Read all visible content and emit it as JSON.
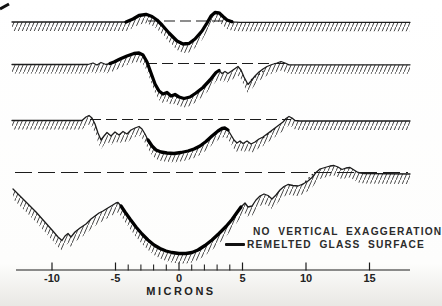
{
  "figure": {
    "background": "#ffffff",
    "ink_color": "#1c1c1c",
    "legend": {
      "line1": "NO VERTICAL EXAGGERATION",
      "line2": "REMELTED GLASS SURFACE",
      "swatch": "thick-black-line"
    }
  },
  "chart_data": {
    "type": "line",
    "title": "",
    "xlabel": "MICRONS",
    "ylabel": "",
    "annotations": [
      "NO VERTICAL EXAGGERATION",
      "REMELTED GLASS SURFACE"
    ],
    "x_axis": {
      "unit": "microns",
      "major_ticks": [
        -10,
        -5,
        0,
        5,
        10,
        15
      ],
      "minor_ticks": [
        -4,
        -3,
        -2,
        -1,
        1,
        2,
        3,
        4
      ],
      "range_px": [
        16,
        410
      ],
      "axis_y_px": 270,
      "x_px_at_zero_microns": 179,
      "px_per_micron": 12.7,
      "tick_label_y_px": 282,
      "xlabel_y_px": 295
    },
    "profiles_note": "Four stacked profilometer traces of a laser crater; hatching = bulk glass below surface; thick line = remelted glass surface; dashed line = original surface level. Coordinates in screen px; microns via x_axis mapping.",
    "profiles": [
      {
        "name": "profile-1-shallow",
        "baseline_y_px": 22,
        "hatch_band_px": 9,
        "dash_pattern": "11 5",
        "dashed_ref": {
          "y": 21,
          "x1": 148,
          "x2": 233
        },
        "remelt_x_range": [
          125,
          233
        ],
        "dotted_segment": null,
        "surface_px": [
          [
            12,
            22
          ],
          [
            126,
            22
          ],
          [
            133,
            19
          ],
          [
            139,
            15.5
          ],
          [
            146,
            14.3
          ],
          [
            152,
            16.5
          ],
          [
            157,
            20
          ],
          [
            162,
            25
          ],
          [
            169,
            33
          ],
          [
            177,
            41
          ],
          [
            183,
            44
          ],
          [
            189,
            43.5
          ],
          [
            195,
            39
          ],
          [
            202,
            31
          ],
          [
            207,
            23
          ],
          [
            211,
            16
          ],
          [
            215,
            12.5
          ],
          [
            219,
            12.8
          ],
          [
            223,
            16.5
          ],
          [
            227,
            20
          ],
          [
            232,
            21.8
          ],
          [
            240,
            22.3
          ],
          [
            410,
            22.3
          ]
        ]
      },
      {
        "name": "profile-2",
        "baseline_y_px": 64.5,
        "hatch_band_px": 9,
        "dash_pattern": "11 5",
        "dashed_ref": {
          "y": 63.5,
          "x1": 146,
          "x2": 288
        },
        "remelt_x_range": [
          110,
          220
        ],
        "dotted_segment": [
          [
            251,
            80
          ],
          [
            265,
            70
          ]
        ],
        "surface_px": [
          [
            12,
            64.5
          ],
          [
            88,
            64.5
          ],
          [
            93,
            63
          ],
          [
            97,
            65
          ],
          [
            101,
            62.5
          ],
          [
            106,
            64.5
          ],
          [
            110,
            63.5
          ],
          [
            114,
            62
          ],
          [
            120,
            59
          ],
          [
            127,
            56
          ],
          [
            134,
            53.5
          ],
          [
            139,
            53
          ],
          [
            143,
            55
          ],
          [
            147,
            62
          ],
          [
            151,
            73
          ],
          [
            155,
            84
          ],
          [
            159,
            91
          ],
          [
            163,
            94
          ],
          [
            167,
            92.5
          ],
          [
            171,
            96
          ],
          [
            175,
            94.5
          ],
          [
            179,
            97
          ],
          [
            184,
            98.5
          ],
          [
            190,
            97
          ],
          [
            196,
            93
          ],
          [
            203,
            87.5
          ],
          [
            210,
            80
          ],
          [
            216,
            72.5
          ],
          [
            219,
            70.5
          ],
          [
            222,
            73.5
          ],
          [
            225,
            71.5
          ],
          [
            228,
            73.5
          ],
          [
            233,
            70
          ],
          [
            238,
            66.5
          ],
          [
            241,
            70
          ],
          [
            244,
            77
          ],
          [
            248,
            84.5
          ],
          [
            251,
            81
          ],
          [
            255,
            76
          ],
          [
            259,
            72
          ],
          [
            263,
            69
          ],
          [
            267,
            66.5
          ],
          [
            272,
            64.5
          ],
          [
            277,
            63
          ],
          [
            281,
            61.5
          ],
          [
            285,
            63
          ],
          [
            289,
            64.8
          ],
          [
            296,
            64.8
          ],
          [
            410,
            64.8
          ]
        ]
      },
      {
        "name": "profile-3",
        "baseline_y_px": 120.5,
        "hatch_band_px": 9,
        "dash_pattern": "11 5",
        "dashed_ref": {
          "y": 119.5,
          "x1": 90,
          "x2": 291
        },
        "remelt_x_range": [
          147,
          228
        ],
        "dotted_segment": [
          [
            263,
            138
          ],
          [
            277,
            127
          ]
        ],
        "surface_px": [
          [
            12,
            120.5
          ],
          [
            82,
            120.5
          ],
          [
            86,
            117
          ],
          [
            89,
            115.5
          ],
          [
            92,
            118
          ],
          [
            95,
            124
          ],
          [
            98,
            133
          ],
          [
            101,
            140
          ],
          [
            104,
            136
          ],
          [
            107,
            132.5
          ],
          [
            111,
            136
          ],
          [
            115,
            132
          ],
          [
            119,
            135
          ],
          [
            123,
            131.5
          ],
          [
            127,
            134
          ],
          [
            131,
            130
          ],
          [
            135,
            128
          ],
          [
            139,
            126.5
          ],
          [
            142,
            129
          ],
          [
            145,
            134
          ],
          [
            148,
            140
          ],
          [
            152,
            146
          ],
          [
            156,
            150
          ],
          [
            161,
            152
          ],
          [
            167,
            153
          ],
          [
            174,
            153.5
          ],
          [
            181,
            152.5
          ],
          [
            188,
            151
          ],
          [
            194,
            149
          ],
          [
            200,
            146
          ],
          [
            206,
            141.5
          ],
          [
            212,
            136
          ],
          [
            218,
            131
          ],
          [
            222,
            128.5
          ],
          [
            225,
            128
          ],
          [
            228,
            130
          ],
          [
            231,
            135
          ],
          [
            234,
            140
          ],
          [
            237,
            143
          ],
          [
            240,
            141
          ],
          [
            243,
            143.5
          ],
          [
            247,
            141
          ],
          [
            251,
            144
          ],
          [
            255,
            142
          ],
          [
            259,
            139
          ],
          [
            263,
            137
          ],
          [
            267,
            134
          ],
          [
            271,
            131
          ],
          [
            275,
            128
          ],
          [
            279,
            125
          ],
          [
            283,
            122
          ],
          [
            286,
            118.5
          ],
          [
            289,
            116.5
          ],
          [
            292,
            118
          ],
          [
            295,
            120.5
          ],
          [
            300,
            121
          ],
          [
            410,
            121
          ]
        ]
      },
      {
        "name": "profile-4-deep",
        "baseline_y_px": 172.5,
        "hatch_band_px": 10,
        "dash_pattern": "17 6",
        "dashed_ref": {
          "y": 172.5,
          "x1": 15,
          "x2": 408
        },
        "remelt_x_range": [
          119,
          243.5
        ],
        "dotted_segment": [
          [
            302,
            185
          ],
          [
            314,
            173
          ]
        ],
        "surface_px": [
          [
            13,
            189
          ],
          [
            20,
            196
          ],
          [
            28,
            204
          ],
          [
            36,
            212
          ],
          [
            44,
            221
          ],
          [
            52,
            230
          ],
          [
            58,
            237
          ],
          [
            62,
            240.5
          ],
          [
            65,
            236
          ],
          [
            68,
            233.5
          ],
          [
            71,
            237
          ],
          [
            75,
            232
          ],
          [
            80,
            228
          ],
          [
            86,
            224
          ],
          [
            91,
            219
          ],
          [
            95,
            216
          ],
          [
            99,
            213
          ],
          [
            103,
            211
          ],
          [
            107,
            208.5
          ],
          [
            112,
            205.5
          ],
          [
            116,
            203
          ],
          [
            118,
            202.5
          ],
          [
            121,
            206
          ],
          [
            125,
            212
          ],
          [
            130,
            219
          ],
          [
            136,
            227
          ],
          [
            142,
            234
          ],
          [
            148,
            240
          ],
          [
            154,
            245
          ],
          [
            160,
            248.5
          ],
          [
            166,
            251
          ],
          [
            172,
            252.5
          ],
          [
            179,
            253.5
          ],
          [
            186,
            253.5
          ],
          [
            192,
            252.5
          ],
          [
            198,
            250
          ],
          [
            205,
            245.5
          ],
          [
            212,
            240
          ],
          [
            219,
            233.5
          ],
          [
            226,
            226.5
          ],
          [
            232,
            219.5
          ],
          [
            237,
            212.5
          ],
          [
            241,
            207
          ],
          [
            245,
            203
          ],
          [
            248,
            207
          ],
          [
            252,
            206
          ],
          [
            256,
            200
          ],
          [
            260,
            196
          ],
          [
            264,
            194
          ],
          [
            268,
            195.5
          ],
          [
            272,
            199
          ],
          [
            276,
            195
          ],
          [
            280,
            190
          ],
          [
            284,
            186.5
          ],
          [
            288,
            184.5
          ],
          [
            293,
            185.5
          ],
          [
            298,
            186
          ],
          [
            303,
            184
          ],
          [
            308,
            181
          ],
          [
            312,
            177.5
          ],
          [
            316,
            172.5
          ],
          [
            320,
            169
          ],
          [
            325,
            167.5
          ],
          [
            330,
            166
          ],
          [
            334,
            165.5
          ],
          [
            338,
            167
          ],
          [
            342,
            169.5
          ],
          [
            346,
            168
          ],
          [
            350,
            167.5
          ],
          [
            354,
            170
          ],
          [
            358,
            172.5
          ],
          [
            364,
            173.5
          ],
          [
            410,
            174
          ]
        ]
      }
    ]
  }
}
